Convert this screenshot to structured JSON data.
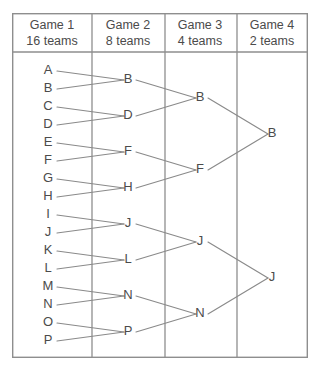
{
  "diagram": {
    "frame": {
      "x": 12,
      "y": 13,
      "width": 296,
      "height": 345,
      "border_color": "#8e8e8e"
    },
    "header_separator_y": 52,
    "line_color": "#8a8a8a",
    "text_color": "#4b4b4b",
    "background": "#ffffff"
  },
  "columns": [
    {
      "id": "game-1",
      "title": "Game 1",
      "subtitle": "16 teams",
      "header_center_x": 52,
      "divider_x": 92,
      "label_x": 48,
      "line_start_x": 57,
      "line_end_x": 124,
      "teams": [
        "A",
        "B",
        "C",
        "D",
        "E",
        "F",
        "G",
        "H",
        "I",
        "J",
        "K",
        "L",
        "M",
        "N",
        "O",
        "P"
      ],
      "team_y": [
        71,
        89,
        107,
        125,
        143,
        161,
        179,
        197,
        215,
        233,
        251,
        269,
        287,
        305,
        323,
        341
      ]
    },
    {
      "id": "game-2",
      "title": "Game 2",
      "subtitle": "8 teams",
      "header_center_x": 128,
      "divider_x": 165,
      "label_x": 128,
      "line_start_x": 136,
      "line_end_x": 196,
      "teams": [
        "B",
        "D",
        "F",
        "H",
        "J",
        "L",
        "N",
        "P"
      ],
      "team_y": [
        80,
        116,
        152,
        188,
        224,
        260,
        296,
        332
      ]
    },
    {
      "id": "game-3",
      "title": "Game 3",
      "subtitle": "4 teams",
      "header_center_x": 200,
      "divider_x": 237,
      "label_x": 200,
      "line_start_x": 208,
      "line_end_x": 268,
      "teams": [
        "B",
        "F",
        "J",
        "N"
      ],
      "team_y": [
        98,
        170,
        242,
        314
      ]
    },
    {
      "id": "game-4",
      "title": "Game 4",
      "subtitle": "2 teams",
      "header_center_x": 272,
      "divider_x": null,
      "label_x": 272,
      "line_start_x": null,
      "line_end_x": null,
      "teams": [
        "B",
        "J"
      ],
      "team_y": [
        134,
        278
      ]
    }
  ],
  "matches": [
    {
      "round": 1,
      "from": [
        "A",
        "B"
      ],
      "winner": "B",
      "from_y": [
        71,
        89
      ],
      "to_y": 80
    },
    {
      "round": 1,
      "from": [
        "C",
        "D"
      ],
      "winner": "D",
      "from_y": [
        107,
        125
      ],
      "to_y": 116
    },
    {
      "round": 1,
      "from": [
        "E",
        "F"
      ],
      "winner": "F",
      "from_y": [
        143,
        161
      ],
      "to_y": 152
    },
    {
      "round": 1,
      "from": [
        "G",
        "H"
      ],
      "winner": "H",
      "from_y": [
        179,
        197
      ],
      "to_y": 188
    },
    {
      "round": 1,
      "from": [
        "I",
        "J"
      ],
      "winner": "J",
      "from_y": [
        215,
        233
      ],
      "to_y": 224
    },
    {
      "round": 1,
      "from": [
        "K",
        "L"
      ],
      "winner": "L",
      "from_y": [
        251,
        269
      ],
      "to_y": 260
    },
    {
      "round": 1,
      "from": [
        "M",
        "N"
      ],
      "winner": "N",
      "from_y": [
        287,
        305
      ],
      "to_y": 296
    },
    {
      "round": 1,
      "from": [
        "O",
        "P"
      ],
      "winner": "P",
      "from_y": [
        323,
        341
      ],
      "to_y": 332
    },
    {
      "round": 2,
      "from": [
        "B",
        "D"
      ],
      "winner": "B",
      "from_y": [
        80,
        116
      ],
      "to_y": 98
    },
    {
      "round": 2,
      "from": [
        "F",
        "H"
      ],
      "winner": "F",
      "from_y": [
        152,
        188
      ],
      "to_y": 170
    },
    {
      "round": 2,
      "from": [
        "J",
        "L"
      ],
      "winner": "J",
      "from_y": [
        224,
        260
      ],
      "to_y": 242
    },
    {
      "round": 2,
      "from": [
        "N",
        "P"
      ],
      "winner": "N",
      "from_y": [
        296,
        332
      ],
      "to_y": 314
    },
    {
      "round": 3,
      "from": [
        "B",
        "F"
      ],
      "winner": "B",
      "from_y": [
        98,
        170
      ],
      "to_y": 134
    },
    {
      "round": 3,
      "from": [
        "J",
        "N"
      ],
      "winner": "J",
      "from_y": [
        242,
        314
      ],
      "to_y": 278
    }
  ]
}
